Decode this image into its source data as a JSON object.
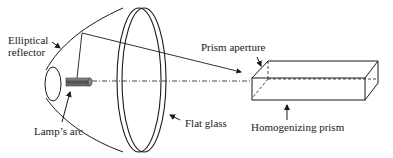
{
  "diagram": {
    "labels": {
      "elliptical_reflector_line1": "Elliptical",
      "elliptical_reflector_line2": "reflector",
      "lamps_arc": "Lamp’s arc",
      "flat_glass": "Flat glass",
      "prism_aperture": "Prism aperture",
      "homogenizing_prism": "Homogenizing prism"
    },
    "colors": {
      "stroke": "#1a1a1a",
      "lamp_fill": "#6a6a6a",
      "background": "#ffffff"
    }
  }
}
